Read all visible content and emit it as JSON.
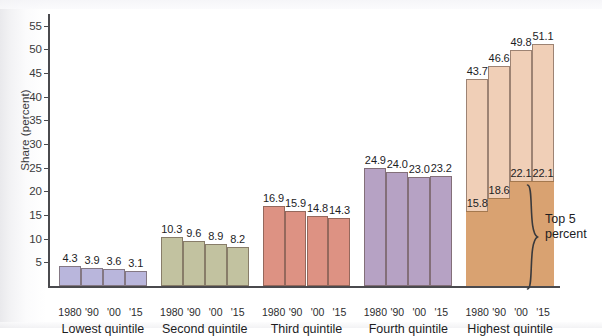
{
  "chart_data": {
    "type": "bar",
    "title": "",
    "subtitle": "",
    "xlabel": "",
    "ylabel": "Share (percent)",
    "ylim": [
      0,
      57.5
    ],
    "yticks": [
      5,
      10,
      15,
      20,
      25,
      30,
      35,
      40,
      45,
      50,
      55
    ],
    "ytick_labels": [
      "5",
      "10",
      "15",
      "20",
      "25",
      "30",
      "35",
      "40",
      "45",
      "50",
      "55"
    ],
    "grid": false,
    "legend": false,
    "x": [
      "1980",
      "'90",
      "'00",
      "'15"
    ],
    "categories": [
      "Lowest quintile",
      "Second quintile",
      "Third quintile",
      "Fourth quintile",
      "Highest quintile"
    ],
    "annotations": [
      {
        "text": "Top 5\npercent",
        "target": "highest-quintile-lower-segment"
      }
    ],
    "groups": [
      {
        "name": "Lowest quintile",
        "color": "#b9b6dc",
        "x": [
          "1980",
          "'90",
          "'00",
          "'15"
        ],
        "values": [
          4.3,
          3.9,
          3.6,
          3.1
        ],
        "labels": [
          "4.3",
          "3.9",
          "3.6",
          "3.1"
        ]
      },
      {
        "name": "Second quintile",
        "color": "#c2c2a0",
        "x": [
          "1980",
          "'90",
          "'00",
          "'15"
        ],
        "values": [
          10.3,
          9.6,
          8.9,
          8.2
        ],
        "labels": [
          "10.3",
          "9.6",
          "8.9",
          "8.2"
        ]
      },
      {
        "name": "Third quintile",
        "color": "#dd9283",
        "x": [
          "1980",
          "'90",
          "'00",
          "'15"
        ],
        "values": [
          16.9,
          15.9,
          14.8,
          14.3
        ],
        "labels": [
          "16.9",
          "15.9",
          "14.8",
          "14.3"
        ]
      },
      {
        "name": "Fourth quintile",
        "color": "#b6a2c4",
        "x": [
          "1980",
          "'90",
          "'00",
          "'15"
        ],
        "values": [
          24.9,
          24.0,
          23.0,
          23.2
        ],
        "labels": [
          "24.9",
          "24.0",
          "23.0",
          "23.2"
        ]
      },
      {
        "name": "Highest quintile",
        "color": "#f0cfb7",
        "stacked": true,
        "x": [
          "1980",
          "'90",
          "'00",
          "'15"
        ],
        "values": [
          43.7,
          46.6,
          49.8,
          51.1
        ],
        "labels": [
          "43.7",
          "46.6",
          "49.8",
          "51.1"
        ],
        "sub_series": {
          "name": "Top 5 percent",
          "color": "#d9a271",
          "values": [
            15.8,
            18.6,
            22.1,
            22.1
          ],
          "labels": [
            "15.8",
            "18.6",
            "22.1",
            "22.1"
          ]
        }
      }
    ]
  },
  "brace": {
    "label_line1": "Top 5",
    "label_line2": "percent"
  }
}
